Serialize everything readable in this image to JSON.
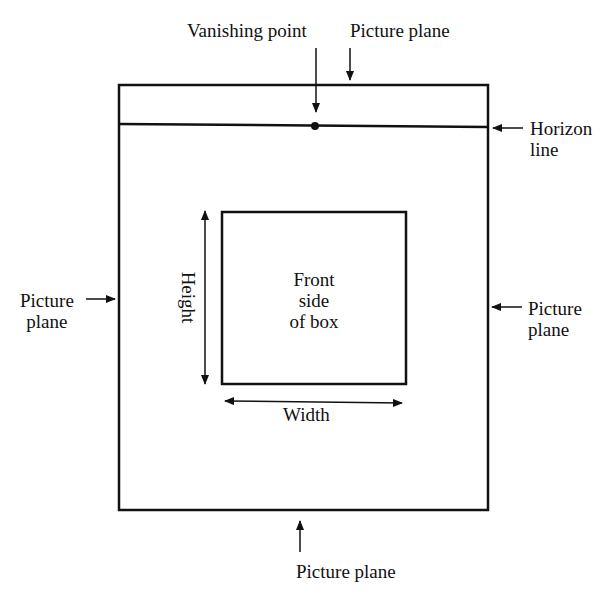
{
  "labels": {
    "vanishing_point": "Vanishing point",
    "picture_plane_top": "Picture plane",
    "horizon_line_1": "Horizon",
    "horizon_line_2": "line",
    "picture_plane_left_1": "Picture",
    "picture_plane_left_2": "plane",
    "picture_plane_right_1": "Picture",
    "picture_plane_right_2": "plane",
    "height": "Height",
    "front_1": "Front",
    "front_2": "side",
    "front_3": "of box",
    "width": "Width",
    "picture_plane_bottom": "Picture plane"
  },
  "colors": {
    "stroke": "#111111",
    "background": "#ffffff"
  }
}
